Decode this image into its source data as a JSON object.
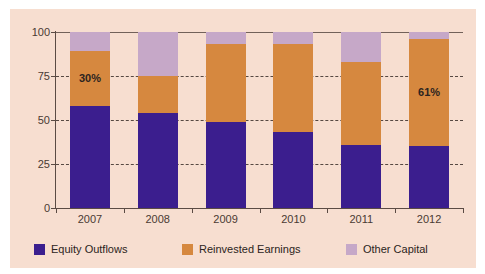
{
  "chart_data": {
    "type": "bar",
    "subtype": "stacked-bar",
    "title": "",
    "subtitle": "",
    "xlabel": "",
    "ylabel": "",
    "categories": [
      "2007",
      "2008",
      "2009",
      "2010",
      "2011",
      "2012"
    ],
    "series": [
      {
        "name": "Equity Outflows",
        "color": "#3b1e8e",
        "values": [
          58,
          54,
          49,
          43,
          36,
          35
        ]
      },
      {
        "name": "Reinvested Earnings",
        "color": "#d6883f",
        "values": [
          31,
          21,
          44,
          50,
          47,
          61
        ]
      },
      {
        "name": "Other Capital",
        "color": "#c6a8c8",
        "values": [
          11,
          25,
          7,
          7,
          17,
          4
        ]
      }
    ],
    "ylim": [
      0,
      100
    ],
    "yticks": [
      0,
      25,
      50,
      75,
      100
    ],
    "ytick_labels": [
      "0",
      "25",
      "50",
      "75",
      "100"
    ],
    "grid": true,
    "grid_style": "dashed-horizontal",
    "legend_position": "bottom",
    "annotations": [
      {
        "text": "30%",
        "category": "2007",
        "series": "Reinvested Earnings"
      },
      {
        "text": "61%",
        "category": "2012",
        "series": "Reinvested Earnings"
      }
    ],
    "background_color": "#f7ded0"
  },
  "legend": {
    "items": [
      {
        "label": "Equity Outflows",
        "color": "#3b1e8e"
      },
      {
        "label": "Reinvested Earnings",
        "color": "#d6883f"
      },
      {
        "label": "Other Capital",
        "color": "#c6a8c8"
      }
    ]
  }
}
